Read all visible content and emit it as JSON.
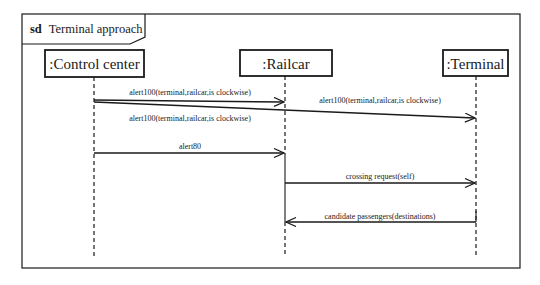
{
  "frame": {
    "keyword": "sd",
    "title": "Terminal approach"
  },
  "lifelines": [
    {
      "id": "control-center",
      "label": ":Control center",
      "x": 94
    },
    {
      "id": "railcar",
      "label": ":Railcar",
      "x": 285
    },
    {
      "id": "terminal",
      "label": ":Terminal",
      "x": 476
    }
  ],
  "messages": [
    {
      "from": "control-center",
      "to": "railcar",
      "label": "alert100(terminal,railcar,is clockwise)"
    },
    {
      "from": "control-center",
      "to": "terminal",
      "label": "alert100(terminal,railcar,is clockwise)",
      "label_upper": "alert100(terminal,railcar,is clockwise)"
    },
    {
      "from": "control-center",
      "to": "railcar",
      "label": "alert80"
    },
    {
      "from": "railcar",
      "to": "terminal",
      "label": "crossing request(self)"
    },
    {
      "from": "terminal",
      "to": "railcar",
      "label": "candidate passengers(destinations)"
    }
  ],
  "colors": {
    "line": "#1a1a1a",
    "background": "#ffffff"
  }
}
